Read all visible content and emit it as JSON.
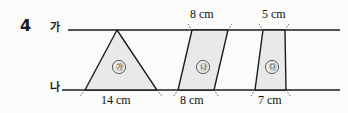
{
  "problem": {
    "number": "4"
  },
  "lines": {
    "top_label": "가",
    "bottom_label": "나"
  },
  "figures": [
    {
      "id": "ga",
      "marker": "㉮",
      "type": "triangle",
      "top_length": "",
      "bottom_length": "14 cm"
    },
    {
      "id": "na",
      "marker": "㉯",
      "type": "parallelogram",
      "top_length": "8 cm",
      "bottom_length": "8 cm"
    },
    {
      "id": "da",
      "marker": "㉰",
      "type": "trapezoid",
      "top_length": "5 cm",
      "bottom_length": "7 cm"
    }
  ],
  "colors": {
    "shape_fill": "#e9e9e7",
    "stroke": "#1c1c1c",
    "page_background": "#fbfbfa"
  }
}
